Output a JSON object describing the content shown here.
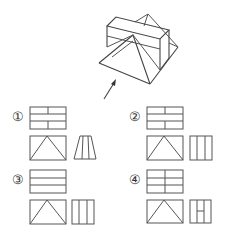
{
  "question": {
    "header_text": "",
    "figure_description": "Isometric solid: rectangular box on top of a triangular prism, with a viewing arrow",
    "view_arrow": "front-view-direction"
  },
  "options": [
    {
      "label": "①",
      "top_view": "3 rows, vertical dividers in rows 1 and 3",
      "front_view": "rectangle with inscribed triangle",
      "side_view": "trapezoid with two inner lines"
    },
    {
      "label": "②",
      "top_view": "3 rows, vertical dividers in rows 1 and 3",
      "front_view": "rectangle with inscribed triangle",
      "side_view": "rectangle with two vertical lines"
    },
    {
      "label": "③",
      "top_view": "3 rows, no vertical dividers",
      "front_view": "rectangle with inscribed triangle",
      "side_view": "rectangle with two vertical lines"
    },
    {
      "label": "④",
      "top_view": "3 rows, vertical dividers in all rows",
      "front_view": "rectangle with inscribed triangle",
      "side_view": "rectangle with two vertical lines and a middle horizontal segment"
    }
  ]
}
